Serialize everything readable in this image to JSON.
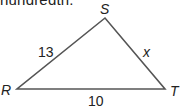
{
  "header": {
    "partial_text": "hundredth."
  },
  "diagram": {
    "type": "triangle",
    "vertices": {
      "S": {
        "label": "S",
        "x": 105,
        "y": 18
      },
      "R": {
        "label": "R",
        "x": 17,
        "y": 89
      },
      "T": {
        "label": "T",
        "x": 165,
        "y": 89
      }
    },
    "sides": {
      "RS": {
        "label": "13"
      },
      "ST": {
        "label": "x"
      },
      "RT": {
        "label": "10"
      }
    },
    "stroke_color": "#555555"
  }
}
